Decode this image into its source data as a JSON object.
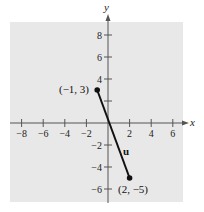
{
  "chart_data": {
    "type": "line",
    "title": "",
    "xlabel": "x",
    "ylabel": "y",
    "xlim": [
      -9,
      7
    ],
    "ylim": [
      -7,
      9
    ],
    "grid": false,
    "x_ticks": [
      -8,
      -6,
      -4,
      -2,
      2,
      4,
      6
    ],
    "y_ticks": [
      -6,
      -4,
      -2,
      2,
      4,
      6,
      8
    ],
    "x_tick_labels": [
      "−8",
      "−6",
      "−4",
      "−2",
      "2",
      "4",
      "6"
    ],
    "y_tick_labels": [
      "−6",
      "−4",
      "−2",
      "",
      "4",
      "6",
      "8"
    ],
    "series": [
      {
        "name": "u",
        "points": [
          {
            "x": -1,
            "y": 3
          },
          {
            "x": 2,
            "y": -5
          }
        ],
        "labels": [
          "(−1, 3)",
          "(2, −5)"
        ]
      }
    ],
    "annotations": [
      {
        "text": "u",
        "x": 1.7,
        "y": -2.6,
        "style": "bold"
      }
    ],
    "colors": {
      "panel": "#e8e8e8",
      "axis": "#555555",
      "line": "#111111"
    }
  }
}
